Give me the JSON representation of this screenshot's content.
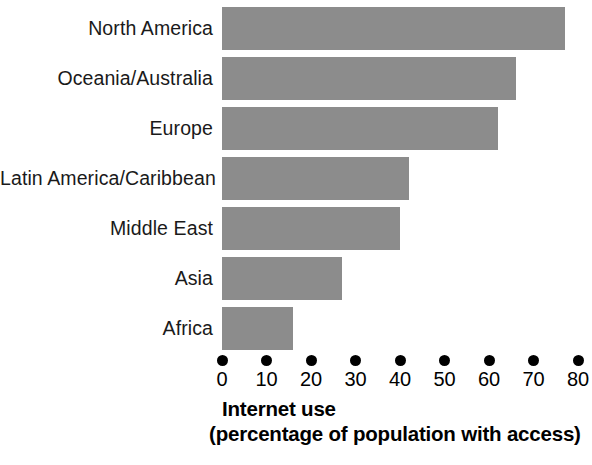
{
  "chart_data": {
    "type": "bar",
    "orientation": "horizontal",
    "title": "",
    "xlabel": "Internet use (percentage of population with access)",
    "ylabel": "",
    "categories": [
      "North America",
      "Oceania/Australia",
      "Europe",
      "Latin America/Caribbean",
      "Middle East",
      "Asia",
      "Africa"
    ],
    "values": [
      77,
      66,
      62,
      42,
      40,
      27,
      16
    ],
    "xlim": [
      0,
      80
    ],
    "xticks": [
      0,
      10,
      20,
      30,
      40,
      50,
      60,
      70,
      80
    ],
    "xtick_labels": [
      "0",
      "10",
      "20",
      "30",
      "40",
      "50",
      "60",
      "70",
      "80"
    ],
    "grid": false,
    "legend": false,
    "bar_color": "#8c8c8c",
    "tick_marker": "dot"
  },
  "caption": {
    "line1": "Internet use",
    "line2": "(percentage of population with access)"
  }
}
